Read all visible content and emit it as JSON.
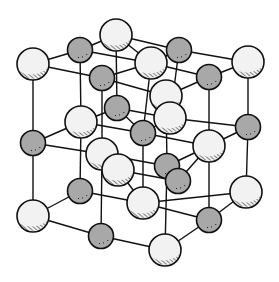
{
  "diagram": {
    "colors": {
      "background": "#ffffff",
      "line": "#111111",
      "large_ion_fill": "#f2f2f2",
      "small_ion_fill": "#a8a8a8"
    },
    "large_radius": 16,
    "small_radius": 12.5,
    "ions": [
      {
        "id": "t1",
        "type": "large",
        "x": 33,
        "y": 64
      },
      {
        "id": "t2",
        "type": "small",
        "x": 80,
        "y": 50
      },
      {
        "id": "t3",
        "type": "large",
        "x": 116,
        "y": 35
      },
      {
        "id": "t4",
        "type": "small",
        "x": 102,
        "y": 78
      },
      {
        "id": "t5",
        "type": "large",
        "x": 151,
        "y": 63
      },
      {
        "id": "t6",
        "type": "small",
        "x": 179,
        "y": 50
      },
      {
        "id": "t7",
        "type": "large",
        "x": 166,
        "y": 96
      },
      {
        "id": "t8",
        "type": "small",
        "x": 209,
        "y": 77
      },
      {
        "id": "t9",
        "type": "large",
        "x": 248,
        "y": 62
      },
      {
        "id": "m1",
        "type": "small",
        "x": 33,
        "y": 143
      },
      {
        "id": "m2",
        "type": "large",
        "x": 81,
        "y": 122
      },
      {
        "id": "m3",
        "type": "small",
        "x": 117,
        "y": 108
      },
      {
        "id": "m4",
        "type": "large",
        "x": 102,
        "y": 154
      },
      {
        "id": "m5",
        "type": "small",
        "x": 143,
        "y": 133
      },
      {
        "id": "m6",
        "type": "large",
        "x": 170,
        "y": 118
      },
      {
        "id": "m7",
        "type": "large",
        "x": 118,
        "y": 170
      },
      {
        "id": "m8",
        "type": "small",
        "x": 167,
        "y": 166
      },
      {
        "id": "m9",
        "type": "large",
        "x": 209,
        "y": 146
      },
      {
        "id": "m10",
        "type": "small",
        "x": 178,
        "y": 181
      },
      {
        "id": "m11",
        "type": "small",
        "x": 248,
        "y": 127
      },
      {
        "id": "b1",
        "type": "large",
        "x": 33,
        "y": 216
      },
      {
        "id": "b2",
        "type": "small",
        "x": 80,
        "y": 191
      },
      {
        "id": "b3",
        "type": "small",
        "x": 101,
        "y": 236
      },
      {
        "id": "b4",
        "type": "large",
        "x": 143,
        "y": 203
      },
      {
        "id": "b5",
        "type": "large",
        "x": 165,
        "y": 250
      },
      {
        "id": "b6",
        "type": "small",
        "x": 209,
        "y": 220
      },
      {
        "id": "b7",
        "type": "large",
        "x": 246,
        "y": 192
      }
    ],
    "bonds": [
      [
        "t1",
        "t2"
      ],
      [
        "t2",
        "t3"
      ],
      [
        "t1",
        "t4"
      ],
      [
        "t4",
        "t7"
      ],
      [
        "t3",
        "t5"
      ],
      [
        "t5",
        "t6"
      ],
      [
        "t6",
        "t9"
      ],
      [
        "t7",
        "t8"
      ],
      [
        "t8",
        "t9"
      ],
      [
        "t2",
        "t5"
      ],
      [
        "t3",
        "t6"
      ],
      [
        "t4",
        "t5"
      ],
      [
        "t5",
        "t8"
      ],
      [
        "t1",
        "m1"
      ],
      [
        "t2",
        "m2"
      ],
      [
        "t3",
        "m3"
      ],
      [
        "t4",
        "m4"
      ],
      [
        "t5",
        "m5"
      ],
      [
        "t6",
        "m6"
      ],
      [
        "t7",
        "m8"
      ],
      [
        "t8",
        "m9"
      ],
      [
        "t9",
        "m11"
      ],
      [
        "m1",
        "m2"
      ],
      [
        "m2",
        "m3"
      ],
      [
        "m1",
        "m4"
      ],
      [
        "m4",
        "m8"
      ],
      [
        "m3",
        "m6"
      ],
      [
        "m6",
        "m11"
      ],
      [
        "m8",
        "m9"
      ],
      [
        "m9",
        "m11"
      ],
      [
        "m2",
        "m5"
      ],
      [
        "m5",
        "m9"
      ],
      [
        "m3",
        "m5"
      ],
      [
        "m5",
        "m6"
      ],
      [
        "m4",
        "m7"
      ],
      [
        "m7",
        "m10"
      ],
      [
        "m10",
        "m9"
      ],
      [
        "m1",
        "b1"
      ],
      [
        "m2",
        "b2"
      ],
      [
        "m4",
        "b3"
      ],
      [
        "m5",
        "b4"
      ],
      [
        "m8",
        "b5"
      ],
      [
        "m9",
        "b6"
      ],
      [
        "m11",
        "b7"
      ],
      [
        "m7",
        "b4"
      ],
      [
        "b1",
        "b2"
      ],
      [
        "b2",
        "b4"
      ],
      [
        "b1",
        "b3"
      ],
      [
        "b3",
        "b5"
      ],
      [
        "b5",
        "b6"
      ],
      [
        "b6",
        "b7"
      ],
      [
        "b4",
        "b6"
      ],
      [
        "b4",
        "b7"
      ]
    ]
  }
}
